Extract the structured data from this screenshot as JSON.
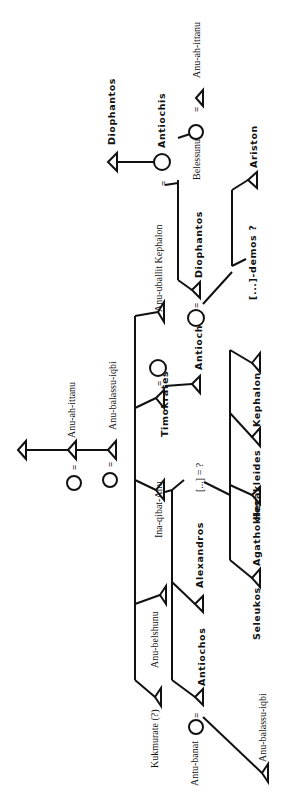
{
  "diagram": {
    "type": "genealogical-tree",
    "orientation": "rotated-90-ccw",
    "people": {
      "p_top_anc": {
        "label": "",
        "sex": "male"
      },
      "p_anu_ah_ittanu_1": {
        "label": "Anu-ah-ittanu",
        "sex": "male"
      },
      "p_anu_balassu_iqbi_1": {
        "label": "Anu-balassu-iqbi",
        "sex": "male"
      },
      "p_wife_1": {
        "label": "",
        "sex": "female"
      },
      "p_wife_2": {
        "label": "",
        "sex": "female"
      },
      "p_kukmurate": {
        "label": "Kukmurate (?)",
        "sex": "male"
      },
      "p_anu_belshunu": {
        "label": "Anu-belshunu",
        "sex": "male"
      },
      "p_ina_qibat_anu": {
        "label": "Ina-qibat-Anu",
        "sex": "male"
      },
      "p_timokrates": {
        "label": "Timokrates",
        "sex": "male"
      },
      "p_timokrates_wife": {
        "label": "",
        "sex": "female"
      },
      "p_antiochos_son": {
        "label": "Antiochos",
        "sex": "male"
      },
      "p_top_son": {
        "label": "",
        "sex": "male"
      },
      "p_antiochos": {
        "label": "Antiochos",
        "sex": "male"
      },
      "p_antu_banat": {
        "label": "Antu-banat",
        "sex": "female"
      },
      "p_anu_balassu_iqbi_2": {
        "label": "Anu-balassu-iqbi",
        "sex": "male"
      },
      "p_alexandros": {
        "label": "Alexandros",
        "sex": "male"
      },
      "p_unknown": {
        "label": "[...] = ?",
        "sex": "unknown"
      },
      "p_seleukos": {
        "label": "Seleukos",
        "sex": "male"
      },
      "p_agathokles": {
        "label": "Agathokles",
        "sex": "male"
      },
      "p_herakleides": {
        "label": "Herakleides",
        "sex": "male"
      },
      "p_kephalon": {
        "label": "Kephalon",
        "sex": "male"
      },
      "p_anu_uballit_kephalon": {
        "label": "Anu-uballit Kephalon",
        "sex": "male"
      },
      "p_diophantos": {
        "label": "Diophantos",
        "sex": "male"
      },
      "p_diophantos_wife": {
        "label": "",
        "sex": "female"
      },
      "p_demos": {
        "label": "[...]-demos ?",
        "sex": "male"
      },
      "p_ariston": {
        "label": "Ariston",
        "sex": "male"
      },
      "p_antiochis": {
        "label": "Antiochis",
        "sex": "female"
      },
      "p_diophantos_2": {
        "label": "Diophantos",
        "sex": "male"
      },
      "p_belessunu": {
        "label": "Belessunu",
        "sex": "female"
      },
      "p_anu_ah_ittanu_2": {
        "label": "Anu-ah-ittanu",
        "sex": "male"
      }
    },
    "marriage_symbol": "=",
    "legend": {
      "male": "triangle",
      "female": "circle"
    }
  }
}
